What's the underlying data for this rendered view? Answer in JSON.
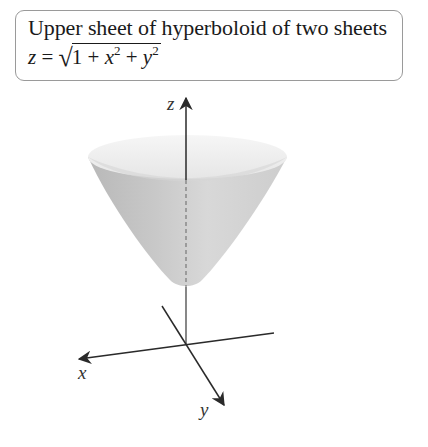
{
  "caption": {
    "title": "Upper sheet of hyperboloid of two sheets",
    "formula": {
      "lhs": "z",
      "equals": "=",
      "radical": "√",
      "radicand_terms": [
        "1",
        "+",
        "x",
        "2",
        "+",
        "y",
        "2"
      ]
    }
  },
  "figure": {
    "surface_name": "hyperboloid upper sheet",
    "axes": {
      "x_label": "x",
      "y_label": "y",
      "z_label": "z"
    },
    "colors": {
      "axis": "#333333",
      "surface_light": "#f2f2f2",
      "surface_mid": "#cfcfcf",
      "surface_dark": "#a8a8a8",
      "rim_inner": "#ececec",
      "caption_border": "#9a9a9a"
    }
  }
}
